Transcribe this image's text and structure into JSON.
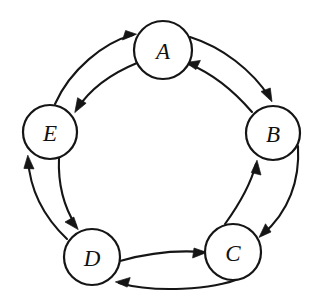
{
  "diagram": {
    "type": "directed-graph",
    "background_color": "#ffffff",
    "stroke_color": "#151515",
    "node_fill_color": "#ffffff",
    "canvas": {
      "width": 327,
      "height": 299
    },
    "nodes": [
      {
        "id": "A",
        "label": "A",
        "cx": 163,
        "cy": 50,
        "r": 29
      },
      {
        "id": "B",
        "label": "B",
        "cx": 273,
        "cy": 133,
        "r": 27
      },
      {
        "id": "C",
        "label": "C",
        "cx": 233,
        "cy": 252,
        "r": 28
      },
      {
        "id": "D",
        "label": "D",
        "cx": 92,
        "cy": 257,
        "r": 28
      },
      {
        "id": "E",
        "label": "E",
        "cx": 50,
        "cy": 132,
        "r": 27
      }
    ],
    "edges": [
      {
        "from": "E",
        "to": "A",
        "curve": "outer",
        "directed": true
      },
      {
        "from": "A",
        "to": "E",
        "curve": "inner",
        "directed": true
      },
      {
        "from": "A",
        "to": "B",
        "curve": "outer",
        "directed": true
      },
      {
        "from": "B",
        "to": "A",
        "curve": "inner",
        "directed": true
      },
      {
        "from": "B",
        "to": "C",
        "curve": "outer",
        "directed": true
      },
      {
        "from": "C",
        "to": "B",
        "curve": "inner",
        "directed": true
      },
      {
        "from": "C",
        "to": "D",
        "curve": "outer",
        "directed": true
      },
      {
        "from": "D",
        "to": "C",
        "curve": "inner",
        "directed": true
      },
      {
        "from": "D",
        "to": "E",
        "curve": "outer",
        "directed": true
      },
      {
        "from": "E",
        "to": "D",
        "curve": "inner",
        "directed": true
      }
    ],
    "edge_count": 10,
    "node_count": 5
  }
}
